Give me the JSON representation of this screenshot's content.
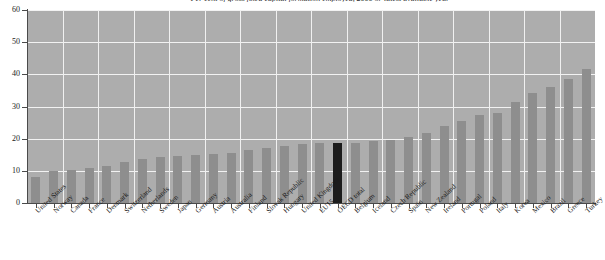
{
  "chart_data": {
    "type": "bar",
    "title": "Per cent of gross fixed capital formation employed, 2000 or latest available year",
    "xlabel": "",
    "ylabel": "",
    "ylim": [
      0,
      60
    ],
    "yticks": [
      0,
      10,
      20,
      30,
      40,
      50,
      60
    ],
    "grid": true,
    "legend": "none",
    "highlight_category": "OECD total",
    "highlight_color": "#1c1c1c",
    "bar_color": "#8e8e8e",
    "plot_background": "#adadad",
    "gridline_color": "#f2f2f2",
    "categories": [
      "United States",
      "Norway",
      "Canada",
      "France",
      "Denmark",
      "Switzerland",
      "Netherlands",
      "Sweden",
      "Japan",
      "Germany",
      "Austria",
      "Australia",
      "Finland",
      "Slovak Republic",
      "Hungary",
      "United Kingdom",
      "EU15",
      "OECD total",
      "Belgium",
      "Iceland",
      "Czech Republic",
      "Spain",
      "New Zealand",
      "Ireland",
      "Portugal",
      "Poland",
      "Italy",
      "Korea",
      "Mexico",
      "Brazil",
      "Greece",
      "Turkey"
    ],
    "values": [
      8.2,
      10.0,
      10.3,
      11.0,
      11.4,
      12.6,
      13.8,
      14.2,
      14.6,
      15.0,
      15.2,
      15.4,
      16.4,
      17.2,
      17.6,
      18.2,
      18.6,
      18.8,
      18.8,
      19.4,
      19.6,
      20.6,
      21.8,
      24.0,
      25.4,
      27.4,
      28.0,
      31.4,
      34.2,
      36.0,
      38.6,
      41.6
    ]
  }
}
